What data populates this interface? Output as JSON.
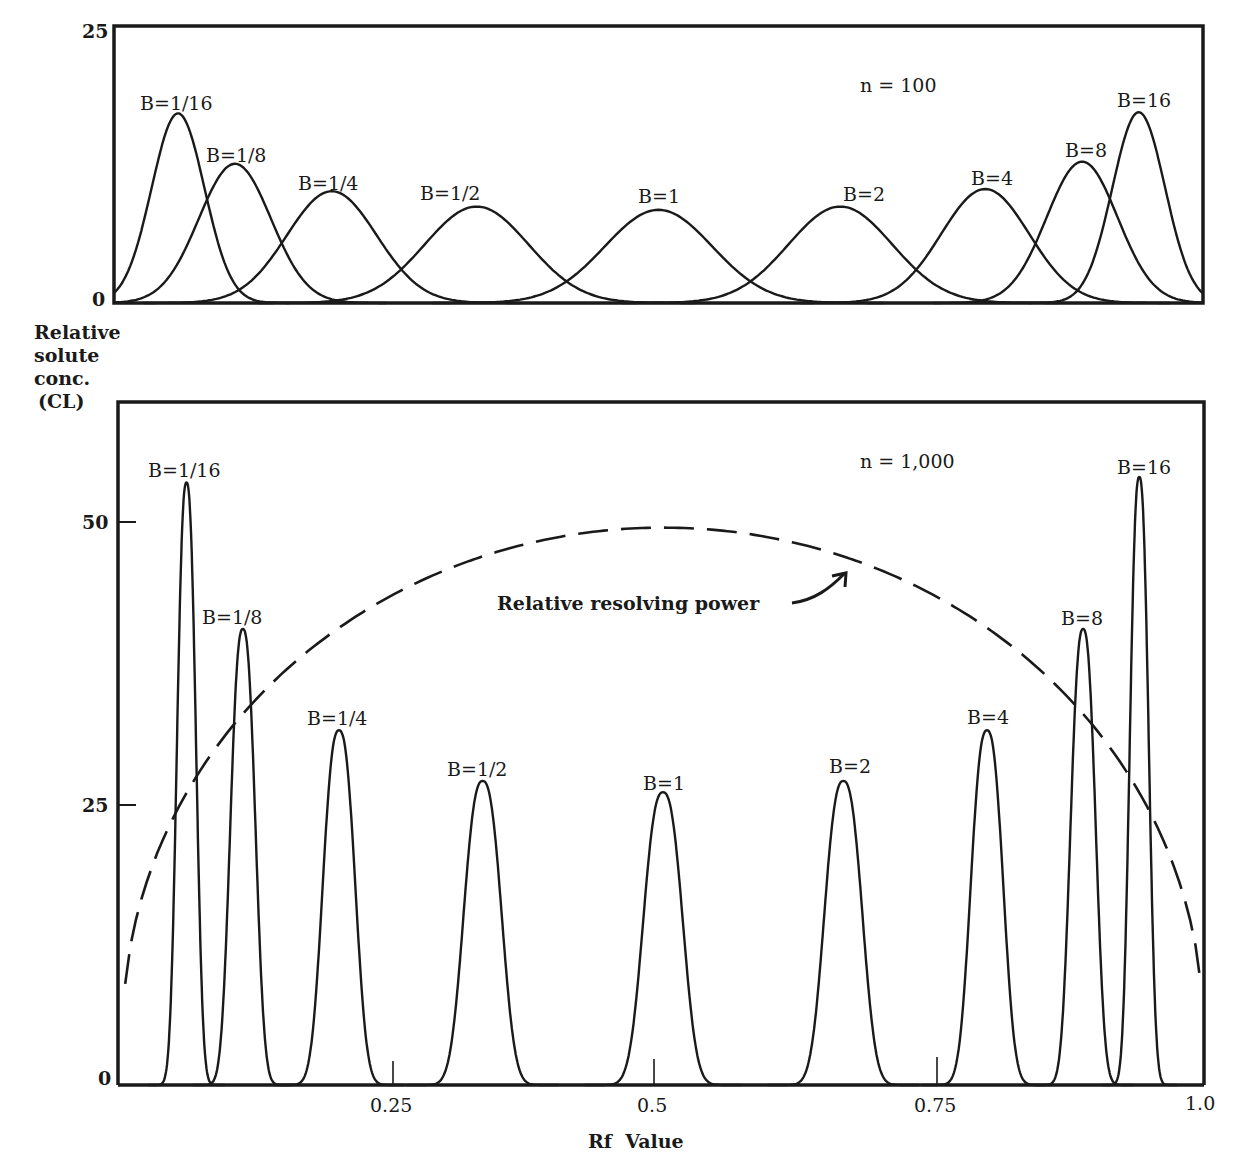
{
  "chart_data": [
    {
      "type": "line",
      "panel": "top",
      "title": "",
      "annotation": "n = 100",
      "xlabel": "",
      "ylabel": "Relative solute conc. (CL)",
      "xlim": [
        0,
        1.0
      ],
      "ylim": [
        0,
        25
      ],
      "yticks": [
        "0",
        "25"
      ],
      "grid": false,
      "legend": "none (series labeled at peaks)",
      "series": [
        {
          "name": "B=1/16",
          "rf": 0.0588,
          "peak": 17.3
        },
        {
          "name": "B=1/8",
          "rf": 0.111,
          "peak": 12.7
        },
        {
          "name": "B=1/4",
          "rf": 0.2,
          "peak": 10.2
        },
        {
          "name": "B=1/2",
          "rf": 0.333,
          "peak": 8.8
        },
        {
          "name": "B=1",
          "rf": 0.5,
          "peak": 8.5
        },
        {
          "name": "B=2",
          "rf": 0.667,
          "peak": 8.8
        },
        {
          "name": "B=4",
          "rf": 0.8,
          "peak": 10.4
        },
        {
          "name": "B=8",
          "rf": 0.889,
          "peak": 12.9
        },
        {
          "name": "B=16",
          "rf": 0.941,
          "peak": 17.4
        }
      ]
    },
    {
      "type": "line",
      "panel": "bottom",
      "title": "",
      "annotation": "n = 1,000",
      "xlabel": "Rf  Value",
      "ylabel": "Relative solute conc. (CL)",
      "xlim": [
        0,
        1.0
      ],
      "ylim": [
        0,
        56
      ],
      "xticks": [
        "0.25",
        "0.5",
        "0.75",
        "1.0"
      ],
      "yticks": [
        "0",
        "25",
        "50"
      ],
      "grid": false,
      "legend": "none (series labeled at peaks)",
      "series": [
        {
          "name": "B=1/16",
          "rf": 0.0588,
          "peak": 53.5
        },
        {
          "name": "B=1/8",
          "rf": 0.111,
          "peak": 40.5
        },
        {
          "name": "B=1/4",
          "rf": 0.2,
          "peak": 31.5
        },
        {
          "name": "B=1/2",
          "rf": 0.333,
          "peak": 27.0
        },
        {
          "name": "B=1",
          "rf": 0.5,
          "peak": 26.0
        },
        {
          "name": "B=2",
          "rf": 0.667,
          "peak": 27.0
        },
        {
          "name": "B=4",
          "rf": 0.8,
          "peak": 31.5
        },
        {
          "name": "B=8",
          "rf": 0.889,
          "peak": 40.5
        },
        {
          "name": "B=16",
          "rf": 0.941,
          "peak": 54.0
        }
      ],
      "dashed_curve": {
        "name": "Relative resolving power",
        "description": "parabolic arc proportional to Rf(1-Rf), max ~49.5 at Rf=0.5",
        "points": [
          [
            0.0,
            5
          ],
          [
            0.05,
            21
          ],
          [
            0.1,
            32
          ],
          [
            0.2,
            42
          ],
          [
            0.3,
            47
          ],
          [
            0.4,
            49
          ],
          [
            0.5,
            49.5
          ],
          [
            0.6,
            49
          ],
          [
            0.7,
            47
          ],
          [
            0.8,
            42
          ],
          [
            0.9,
            32
          ],
          [
            0.95,
            21
          ],
          [
            1.0,
            5
          ]
        ]
      }
    }
  ],
  "top": {
    "annotation": "n = 100",
    "ytick_top": "25",
    "ytick_zero": "0",
    "labels": [
      "B=1/16",
      "B=1/8",
      "B=1/4",
      "B=1/2",
      "B=1",
      "B=2",
      "B=4",
      "B=8",
      "B=16"
    ]
  },
  "ylabel": {
    "line1": "Relative",
    "line2": "solute",
    "line3": "conc.",
    "line4": "(CL)"
  },
  "bottom": {
    "annotation": "n = 1,000",
    "ytick_50": "50",
    "ytick_25": "25",
    "ytick_0": "0",
    "xtick_025": "0.25",
    "xtick_05": "0.5",
    "xtick_075": "0.75",
    "xtick_10": "1.0",
    "xlabel": "Rf  Value",
    "curve_label": "Relative resolving power",
    "labels": [
      "B=1/16",
      "B=1/8",
      "B=1/4",
      "B=1/2",
      "B=1",
      "B=2",
      "B=4",
      "B=8",
      "B=16"
    ]
  }
}
